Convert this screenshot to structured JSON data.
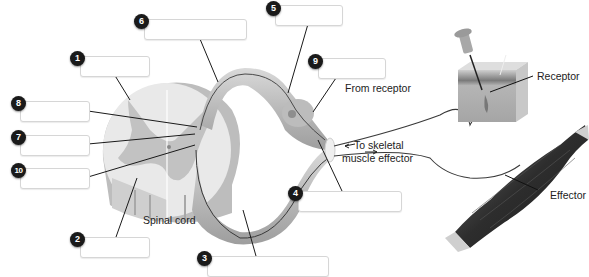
{
  "diagram": {
    "structure_labels": {
      "spinal_cord": "Spinal cord",
      "receptor": "Receptor",
      "effector": "Effector",
      "from_receptor": "From receptor",
      "to_effector_line1": "To skeletal",
      "to_effector_line2": "muscle effector"
    },
    "answer_boxes": [
      {
        "number": "1",
        "value": ""
      },
      {
        "number": "2",
        "value": ""
      },
      {
        "number": "3",
        "value": ""
      },
      {
        "number": "4",
        "value": ""
      },
      {
        "number": "5",
        "value": ""
      },
      {
        "number": "6",
        "value": ""
      },
      {
        "number": "7",
        "value": ""
      },
      {
        "number": "8",
        "value": ""
      },
      {
        "number": "9",
        "value": ""
      },
      {
        "number": "10",
        "value": ""
      }
    ]
  }
}
